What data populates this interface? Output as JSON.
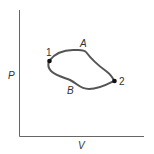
{
  "diagram": {
    "type": "pv-cycle",
    "axes": {
      "y_label": "P",
      "x_label": "V"
    },
    "points": [
      {
        "id": "1",
        "label": "1"
      },
      {
        "id": "2",
        "label": "2"
      }
    ],
    "paths": [
      {
        "id": "A",
        "label": "A",
        "from": "1",
        "to": "2"
      },
      {
        "id": "B",
        "label": "B",
        "from": "2",
        "to": "1"
      }
    ],
    "colors": {
      "curve": "#555555",
      "axis": "#666666",
      "point": "#111111",
      "text": "#333333"
    }
  }
}
